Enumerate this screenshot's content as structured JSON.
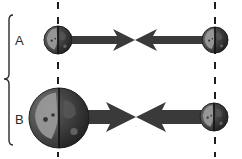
{
  "diagram": {
    "type": "gravitational-force-comparison",
    "background": "#ffffff",
    "colors": {
      "arrow": "#3a3a3a",
      "dash": "#1e1e1e",
      "brace": "#2a2a2a",
      "planet_dark": "#3c3c3c",
      "planet_light": "#9a9a9a",
      "planet_mid": "#6e6e6e"
    },
    "brace": {
      "x": 10,
      "top": 15,
      "bottom": 145,
      "tip_y": 79
    },
    "dashed_lines": [
      {
        "x": 58,
        "label": "left-axis"
      },
      {
        "x": 215,
        "label": "right-axis"
      }
    ],
    "rows": [
      {
        "label": "A",
        "label_pos": {
          "x": 15,
          "y": 34
        },
        "y": 40,
        "left_body": {
          "cx": 58,
          "cy": 40,
          "r": 14,
          "size": "small"
        },
        "right_body": {
          "cx": 215,
          "cy": 40,
          "r": 13,
          "size": "small"
        },
        "left_arrow": {
          "from": 70,
          "tip": 135,
          "bar_height": 8,
          "head_length": 22,
          "head_height": 22
        },
        "right_arrow": {
          "from": 203,
          "tip": 135,
          "bar_height": 8,
          "head_length": 22,
          "head_height": 22
        }
      },
      {
        "label": "B",
        "label_pos": {
          "x": 15,
          "y": 113
        },
        "y": 117,
        "left_body": {
          "cx": 59,
          "cy": 118,
          "r": 30,
          "size": "large"
        },
        "right_body": {
          "cx": 214,
          "cy": 117,
          "r": 14,
          "size": "small"
        },
        "left_arrow": {
          "from": 86,
          "tip": 136,
          "bar_height": 14,
          "head_length": 30,
          "head_height": 30
        },
        "right_arrow": {
          "from": 202,
          "tip": 136,
          "bar_height": 14,
          "head_length": 30,
          "head_height": 30
        }
      }
    ]
  }
}
